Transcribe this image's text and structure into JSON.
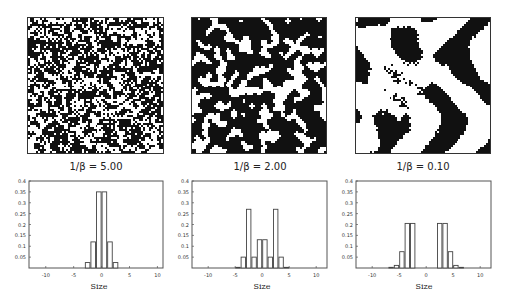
{
  "panels": [
    {
      "caption": "1/β = 5.00",
      "pattern": "noise-fine"
    },
    {
      "caption": "1/β = 2.00",
      "pattern": "noise-clustered"
    },
    {
      "caption": "1/β = 0.10",
      "pattern": "labyrinth-stripes"
    }
  ],
  "chart_data": [
    {
      "type": "bar",
      "title": "1/β = 5.00",
      "xlabel": "Size",
      "ylabel": "",
      "xlim": [
        -13,
        11
      ],
      "ylim": [
        0,
        0.4
      ],
      "xticks": [
        -10,
        -5,
        0,
        5,
        10
      ],
      "yticks": [
        0.05,
        0.1,
        0.15,
        0.2,
        0.25,
        0.3,
        0.35,
        0.4
      ],
      "ytick_labels": [
        "0.05",
        "0.1",
        "0.15",
        "0.2",
        "0.25",
        "0.3",
        "0.35",
        "0.4"
      ],
      "x": [
        -2.5,
        -1.5,
        -0.5,
        0.5,
        1.5,
        2.5
      ],
      "values": [
        0.025,
        0.12,
        0.35,
        0.35,
        0.12,
        0.025
      ],
      "grid": false
    },
    {
      "type": "bar",
      "title": "1/β = 2.00",
      "xlabel": "Size",
      "ylabel": "",
      "xlim": [
        -13,
        12
      ],
      "ylim": [
        0,
        0.4
      ],
      "xticks": [
        -10,
        -5,
        0,
        5,
        10
      ],
      "yticks": [
        0.05,
        0.1,
        0.15,
        0.2,
        0.25,
        0.3,
        0.35,
        0.4
      ],
      "ytick_labels": [
        "0.05",
        "0.1",
        "0.15",
        "0.2",
        "0.25",
        "0.3",
        "0.35",
        "0.4"
      ],
      "x": [
        -4.5,
        -3.5,
        -2.5,
        -1.5,
        -0.5,
        0.5,
        1.5,
        2.5,
        3.5,
        4.5
      ],
      "values": [
        0.003,
        0.05,
        0.27,
        0.05,
        0.13,
        0.13,
        0.05,
        0.27,
        0.05,
        0.003
      ],
      "grid": false
    },
    {
      "type": "bar",
      "title": "1/β = 0.10",
      "xlabel": "Size",
      "ylabel": "",
      "xlim": [
        -13,
        12
      ],
      "ylim": [
        0,
        0.4
      ],
      "xticks": [
        -10,
        -5,
        0,
        5,
        10
      ],
      "yticks": [
        0.05,
        0.1,
        0.15,
        0.2,
        0.25,
        0.3,
        0.35,
        0.4
      ],
      "ytick_labels": [
        "0.05",
        "0.1",
        "0.15",
        "0.2",
        "0.25",
        "0.3",
        "0.35",
        "0.4"
      ],
      "x": [
        -6.5,
        -5.5,
        -4.5,
        -3.5,
        -2.5,
        2.5,
        3.5,
        4.5,
        5.5,
        6.5
      ],
      "values": [
        0.003,
        0.012,
        0.075,
        0.205,
        0.205,
        0.205,
        0.205,
        0.075,
        0.012,
        0.003
      ],
      "grid": false
    }
  ]
}
